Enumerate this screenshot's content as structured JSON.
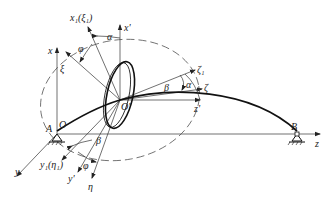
{
  "figure": {
    "labels": {
      "x1_xi1": "x₁(ξ₁)",
      "x_prime": "x'",
      "x": "x",
      "xi": "ξ",
      "phi_top": "φ",
      "alpha_top": "α",
      "zeta1": "ζ₁",
      "zeta": "ζ",
      "beta_right": "β",
      "alpha_right": "α",
      "z_prime": "z'",
      "O_prime": "O'",
      "O": "O",
      "A": "A",
      "B": "B",
      "z": "z",
      "y": "y",
      "y1_eta1": "y₁(η₁)",
      "beta_bottom": "β",
      "phi_bottom": "φ",
      "y_prime": "y'",
      "eta": "η"
    },
    "supports": [
      "pin-support-A",
      "pin-support-B"
    ],
    "colors": {
      "line": "#222222",
      "background": "#ffffff"
    }
  }
}
